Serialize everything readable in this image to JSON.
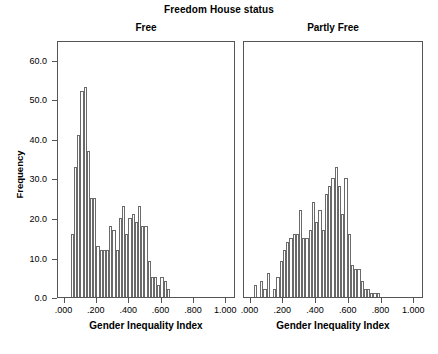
{
  "chart_data": {
    "type": "bar",
    "title": "Freedom House status",
    "ylabel": "Frequency",
    "ylim": [
      0,
      65
    ],
    "ytick_labels": [
      "0.0",
      "10.0",
      "20.0",
      "30.0",
      "40.0",
      "50.0",
      "60.0"
    ],
    "ytick_values": [
      0,
      10,
      20,
      30,
      40,
      50,
      60
    ],
    "xlim": [
      -0.04,
      1.06
    ],
    "xtick_labels": [
      ".000",
      ".200",
      ".400",
      ".600",
      ".800",
      "1.000"
    ],
    "xtick_values": [
      0.0,
      0.2,
      0.4,
      0.6,
      0.8,
      1.0
    ],
    "grid": false,
    "legend": "none",
    "bin_width": 0.02,
    "panels": [
      {
        "label": "Free",
        "xlabel": "Gender Inequality Index",
        "bin_starts": [
          0.04,
          0.06,
          0.08,
          0.1,
          0.12,
          0.14,
          0.16,
          0.18,
          0.2,
          0.22,
          0.24,
          0.26,
          0.28,
          0.3,
          0.32,
          0.34,
          0.36,
          0.38,
          0.4,
          0.42,
          0.44,
          0.46,
          0.48,
          0.5,
          0.52,
          0.54,
          0.56,
          0.58,
          0.6,
          0.62,
          0.64,
          0.66,
          0.68,
          0.7,
          0.72,
          0.74
        ],
        "values": [
          16,
          33,
          41,
          52,
          53,
          37,
          25,
          25,
          13,
          12,
          12,
          12,
          18,
          17,
          12,
          20,
          23,
          16,
          20,
          21,
          19,
          23,
          18,
          18,
          9,
          5,
          5,
          3,
          5,
          4,
          2,
          0,
          0,
          0,
          0,
          0
        ]
      },
      {
        "label": "Partly Free",
        "xlabel": "Gender Inequality Index",
        "bin_starts": [
          0.02,
          0.06,
          0.08,
          0.1,
          0.14,
          0.16,
          0.18,
          0.2,
          0.22,
          0.24,
          0.26,
          0.28,
          0.3,
          0.32,
          0.34,
          0.36,
          0.38,
          0.4,
          0.42,
          0.44,
          0.46,
          0.48,
          0.5,
          0.52,
          0.54,
          0.56,
          0.58,
          0.6,
          0.62,
          0.64,
          0.66,
          0.68,
          0.7,
          0.72,
          0.74,
          0.76,
          0.78,
          0.8,
          0.82
        ],
        "values": [
          3,
          4,
          2,
          6,
          2,
          5,
          9,
          12,
          14,
          15,
          16,
          16,
          22,
          15,
          15,
          17,
          24,
          19,
          22,
          17,
          26,
          28,
          30,
          33,
          28,
          21,
          30,
          16,
          8,
          7,
          7,
          4,
          2,
          2,
          1,
          1,
          1,
          0,
          0
        ]
      }
    ]
  }
}
